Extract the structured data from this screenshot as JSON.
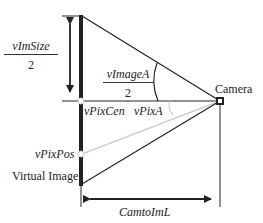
{
  "diagram": {
    "labels": {
      "im_size_num": "vImSize",
      "im_size_den": "2",
      "image_angle_num": "vImageA",
      "image_angle_den": "2",
      "camera": "Camera",
      "pix_cen": "vPixCen",
      "pix_angle": "vPixA",
      "pix_pos": "vPixPos",
      "virtual_image": "Virtual Image",
      "cam_to_im": "CamtoImL"
    },
    "colors": {
      "line": "#222222",
      "light_ray": "#d0d0d0",
      "background": "#ffffff"
    }
  }
}
